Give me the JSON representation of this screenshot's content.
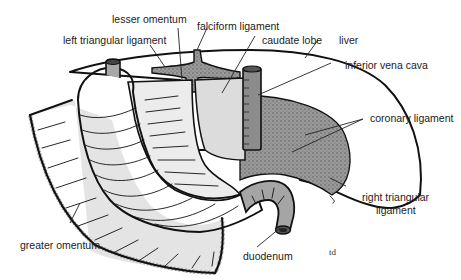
{
  "diagram": {
    "signature": "td",
    "colors": {
      "liver": "#d8d8d8",
      "stomach": "#b5b5b5",
      "omentum": "#e3e3e3",
      "bare_area": "#8a8a8a",
      "outline": "#111111",
      "label_text": "#222222"
    },
    "labels": {
      "lesser_omentum": "lesser omentum",
      "falciform_ligament": "falciform ligament",
      "left_triangular_ligament": "left triangular ligament",
      "caudate_lobe": "caudate lobe",
      "liver": "liver",
      "inferior_vena_cava": "inferior vena cava",
      "coronary_ligament": "coronary ligament",
      "right_triangular_ligament_line1": "right triangular",
      "right_triangular_ligament_line2": "ligament",
      "greater_omentum": "greater omentum",
      "duodenum": "duodenum"
    }
  }
}
